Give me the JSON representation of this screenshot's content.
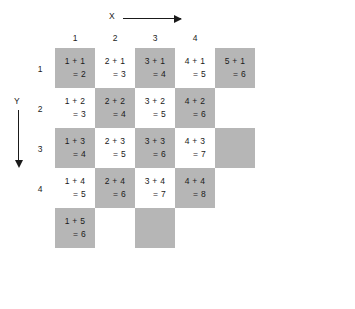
{
  "figure": {
    "title": "",
    "axes": {
      "x_label": "X",
      "x_arrow": "right-arrow",
      "y_label": "Y",
      "y_arrow": "down-arrow"
    },
    "column_headers": [
      "1",
      "2",
      "3",
      "4"
    ],
    "row_headers": [
      "1",
      "2",
      "3",
      "4"
    ],
    "colors": {
      "shaded": "#b6b6b6",
      "plain": "#ffffff",
      "text": "#1a1a1a",
      "background": "#ffffff"
    }
  },
  "chart_data": {
    "type": "table",
    "title": "",
    "xlabel": "X",
    "ylabel": "Y",
    "categories": [
      "1",
      "2",
      "3",
      "4"
    ],
    "rows": [
      "1",
      "2",
      "3",
      "4",
      "5"
    ],
    "cells": [
      {
        "col": 1,
        "row": 1,
        "line1": "1 + 1",
        "line2": "= 2",
        "value": 2,
        "shaded": true
      },
      {
        "col": 2,
        "row": 1,
        "line1": "2 + 1",
        "line2": "= 3",
        "value": 3,
        "shaded": false
      },
      {
        "col": 3,
        "row": 1,
        "line1": "3 + 1",
        "line2": "= 4",
        "value": 4,
        "shaded": true
      },
      {
        "col": 4,
        "row": 1,
        "line1": "4 + 1",
        "line2": "= 5",
        "value": 5,
        "shaded": false
      },
      {
        "col": 5,
        "row": 1,
        "line1": "5 + 1",
        "line2": "= 6",
        "value": 6,
        "shaded": true
      },
      {
        "col": 1,
        "row": 2,
        "line1": "1 + 2",
        "line2": "= 3",
        "value": 3,
        "shaded": false
      },
      {
        "col": 2,
        "row": 2,
        "line1": "2 + 2",
        "line2": "= 4",
        "value": 4,
        "shaded": true
      },
      {
        "col": 3,
        "row": 2,
        "line1": "3 + 2",
        "line2": "= 5",
        "value": 5,
        "shaded": false
      },
      {
        "col": 4,
        "row": 2,
        "line1": "4 + 2",
        "line2": "= 6",
        "value": 6,
        "shaded": true
      },
      {
        "col": 5,
        "row": 2,
        "line1": "",
        "line2": "",
        "value": null,
        "shaded": false
      },
      {
        "col": 1,
        "row": 3,
        "line1": "1 + 3",
        "line2": "= 4",
        "value": 4,
        "shaded": true
      },
      {
        "col": 2,
        "row": 3,
        "line1": "2 + 3",
        "line2": "= 5",
        "value": 5,
        "shaded": false
      },
      {
        "col": 3,
        "row": 3,
        "line1": "3 + 3",
        "line2": "= 6",
        "value": 6,
        "shaded": true
      },
      {
        "col": 4,
        "row": 3,
        "line1": "4 + 3",
        "line2": "= 7",
        "value": 7,
        "shaded": false
      },
      {
        "col": 5,
        "row": 3,
        "line1": "",
        "line2": "",
        "value": null,
        "shaded": true
      },
      {
        "col": 1,
        "row": 4,
        "line1": "1 + 4",
        "line2": "= 5",
        "value": 5,
        "shaded": false
      },
      {
        "col": 2,
        "row": 4,
        "line1": "2 + 4",
        "line2": "= 6",
        "value": 6,
        "shaded": true
      },
      {
        "col": 3,
        "row": 4,
        "line1": "3 + 4",
        "line2": "= 7",
        "value": 7,
        "shaded": false
      },
      {
        "col": 4,
        "row": 4,
        "line1": "4 + 4",
        "line2": "= 8",
        "value": 8,
        "shaded": true
      },
      {
        "col": 1,
        "row": 5,
        "line1": "1 + 5",
        "line2": "= 6",
        "value": 6,
        "shaded": true
      },
      {
        "col": 2,
        "row": 5,
        "line1": "",
        "line2": "",
        "value": null,
        "shaded": false
      },
      {
        "col": 3,
        "row": 5,
        "line1": "",
        "line2": "",
        "value": null,
        "shaded": true
      }
    ]
  }
}
